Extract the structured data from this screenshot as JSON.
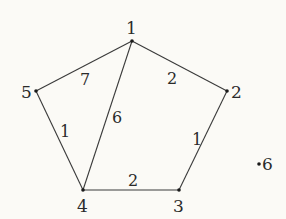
{
  "diagram": {
    "type": "weighted-undirected-graph",
    "colors": {
      "background": "#fbfaf6",
      "edge": "#3a3a3a",
      "node": "#1a1a1a",
      "text": "#2a2a2a"
    },
    "nodes": [
      {
        "id": "1",
        "label": "1",
        "x": 132,
        "y": 41,
        "lx": 126,
        "ly": 34
      },
      {
        "id": "2",
        "label": "2",
        "x": 227,
        "y": 91,
        "lx": 231,
        "ly": 98
      },
      {
        "id": "3",
        "label": "3",
        "x": 179,
        "y": 190,
        "lx": 173,
        "ly": 212
      },
      {
        "id": "4",
        "label": "4",
        "x": 83,
        "y": 190,
        "lx": 77,
        "ly": 212
      },
      {
        "id": "5",
        "label": "5",
        "x": 36,
        "y": 91,
        "lx": 21,
        "ly": 98
      },
      {
        "id": "6",
        "label": "6",
        "x": 259,
        "y": 164,
        "lx": 262,
        "ly": 170
      }
    ],
    "edges": [
      {
        "from": "1",
        "to": "5",
        "weight": "7",
        "wx": 80,
        "wy": 85
      },
      {
        "from": "1",
        "to": "2",
        "weight": "2",
        "wx": 167,
        "wy": 84
      },
      {
        "from": "1",
        "to": "4",
        "weight": "6",
        "wx": 112,
        "wy": 123
      },
      {
        "from": "5",
        "to": "4",
        "weight": "1",
        "wx": 60,
        "wy": 137
      },
      {
        "from": "2",
        "to": "3",
        "weight": "1",
        "wx": 192,
        "wy": 145
      },
      {
        "from": "4",
        "to": "3",
        "weight": "2",
        "wx": 128,
        "wy": 186
      }
    ]
  }
}
